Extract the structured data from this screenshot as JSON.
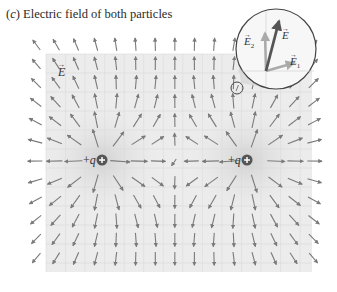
{
  "caption": {
    "prefix": "(",
    "letter": "c",
    "suffix": ") Electric field of both particles"
  },
  "field_label": "E",
  "charges": [
    {
      "label": "+q",
      "x": 102,
      "y": 160,
      "sign": "+"
    },
    {
      "label": "+q",
      "x": 247,
      "y": 160,
      "sign": "+"
    }
  ],
  "grid": {
    "x0": 38,
    "y0": 47,
    "dx": 19.55,
    "dy": 19.0,
    "cols": 15,
    "rows": 12,
    "region": {
      "x": 46,
      "y": 54,
      "w": 266,
      "h": 218
    }
  },
  "inset": {
    "cx": 276,
    "cy": 49,
    "r": 40,
    "labels": {
      "E": "E",
      "E1": "E",
      "E1_sub": "1",
      "E2": "E",
      "E2_sub": "2"
    },
    "probe_point": {
      "x": 237,
      "y": 88,
      "r": 6
    }
  },
  "colors": {
    "background": "#ffffff",
    "grid_fill": "#ececec",
    "grid_line": "#dadada",
    "arrow": "#7a7a7a",
    "charge_fill": "#555555",
    "inset_stroke": "#444444",
    "glow": "#d4d4d4"
  }
}
